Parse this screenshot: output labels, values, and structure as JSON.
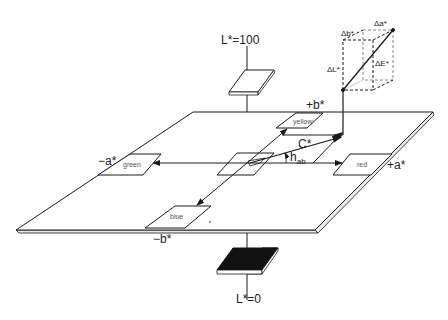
{
  "axes": {
    "L_top": "L*=100",
    "L_bottom": "L*=0",
    "plus_b": "+b*",
    "minus_b": "−b*",
    "plus_a": "+a*",
    "minus_a": "−a*"
  },
  "patches": {
    "yellow": "yellow",
    "green": "green",
    "red": "red",
    "blue": "blue"
  },
  "vectors": {
    "chroma": "C*",
    "hue_angle": "h",
    "hue_angle_sub": "ab"
  },
  "delta_cube": {
    "delta_L": "ΔL*",
    "delta_a": "Δa*",
    "delta_b": "Δb*",
    "delta_E": "ΔE*"
  },
  "colors": {
    "line": "#1a1a1a",
    "black_patch": "#111111",
    "background": "#ffffff"
  }
}
